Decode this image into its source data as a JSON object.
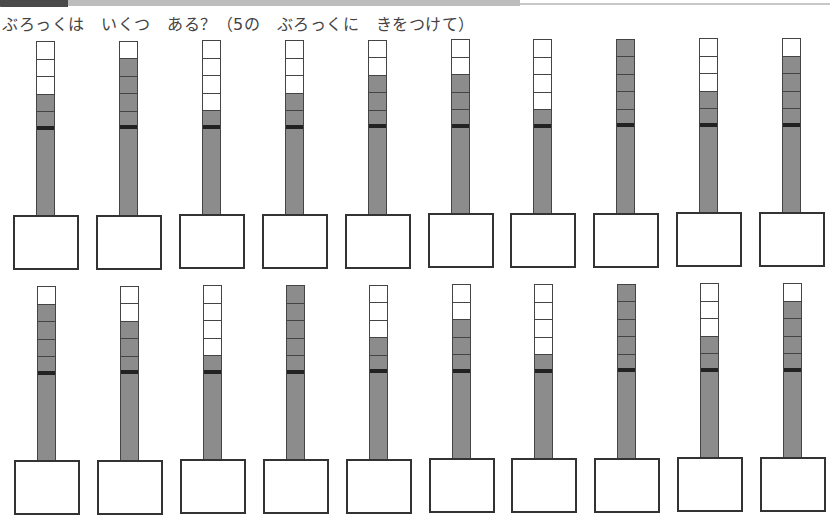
{
  "header": {
    "instruction": "ぶろっくは　いくつ　ある？（5の　ぶろっくに　きをつけて）"
  },
  "colors": {
    "filled": "#8c8c8c",
    "empty": "#ffffff",
    "border": "#444444"
  },
  "rows": [
    {
      "items": [
        {
          "total": 7,
          "filled_cells": 2,
          "answer": ""
        },
        {
          "total": 9,
          "filled_cells": 4,
          "answer": ""
        },
        {
          "total": 6,
          "filled_cells": 1,
          "answer": ""
        },
        {
          "total": 7,
          "filled_cells": 2,
          "answer": ""
        },
        {
          "total": 8,
          "filled_cells": 3,
          "answer": ""
        },
        {
          "total": 8,
          "filled_cells": 3,
          "answer": ""
        },
        {
          "total": 6,
          "filled_cells": 1,
          "answer": ""
        },
        {
          "total": 10,
          "filled_cells": 5,
          "answer": ""
        },
        {
          "total": 7,
          "filled_cells": 2,
          "answer": ""
        },
        {
          "total": 9,
          "filled_cells": 4,
          "answer": ""
        }
      ]
    },
    {
      "items": [
        {
          "total": 9,
          "filled_cells": 4,
          "answer": ""
        },
        {
          "total": 8,
          "filled_cells": 3,
          "answer": ""
        },
        {
          "total": 6,
          "filled_cells": 1,
          "answer": ""
        },
        {
          "total": 10,
          "filled_cells": 5,
          "answer": ""
        },
        {
          "total": 7,
          "filled_cells": 2,
          "answer": ""
        },
        {
          "total": 8,
          "filled_cells": 3,
          "answer": ""
        },
        {
          "total": 6,
          "filled_cells": 1,
          "answer": ""
        },
        {
          "total": 10,
          "filled_cells": 5,
          "answer": ""
        },
        {
          "total": 7,
          "filled_cells": 2,
          "answer": ""
        },
        {
          "total": 9,
          "filled_cells": 4,
          "answer": ""
        }
      ]
    }
  ]
}
